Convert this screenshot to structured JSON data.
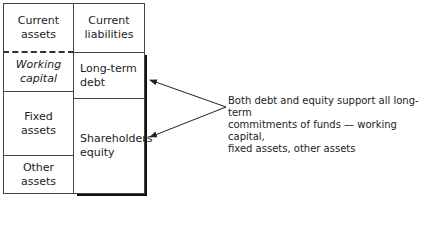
{
  "diagram": {
    "left_column": [
      {
        "label_line1": "Current",
        "label_line2": "assets",
        "italic": false
      },
      {
        "label_line1": "Working",
        "label_line2": "capital",
        "italic": true
      },
      {
        "label_line1": "Fixed",
        "label_line2": "assets",
        "italic": false
      },
      {
        "label_line1": "Other",
        "label_line2": "assets",
        "italic": false
      }
    ],
    "right_column": [
      {
        "label_line1": "Current",
        "label_line2": "liabilities"
      },
      {
        "label_line1": "Long-term",
        "label_line2": "debt"
      },
      {
        "label_line1": "Shareholders'",
        "label_line2": "equity"
      }
    ],
    "annotation": {
      "line1": "Both debt and equity support all long-term",
      "line2": "commitments of funds — working capital,",
      "line3": "fixed assets, other assets"
    }
  }
}
